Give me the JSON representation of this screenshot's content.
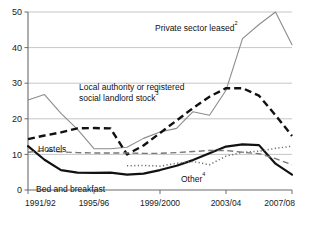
{
  "chart_data": {
    "type": "line",
    "title": "",
    "subtitle": "",
    "xlabel": "",
    "ylabel": "",
    "grid": true,
    "legend_position": "inline-annotations",
    "xlim": [
      1991,
      2007
    ],
    "ylim": [
      0,
      50
    ],
    "yticks": [
      0,
      10,
      20,
      30,
      40,
      50
    ],
    "ytick_labels": [
      "0",
      "10",
      "20",
      "30",
      "40",
      "50"
    ],
    "xticks": [
      1991,
      1995,
      1999,
      2003,
      2007
    ],
    "xtick_labels": [
      "1991/92",
      "1995/96",
      "1999/2000",
      "2003/04",
      "2007/08"
    ],
    "x": [
      1991,
      1992,
      1993,
      1994,
      1995,
      1996,
      1997,
      1998,
      1999,
      2000,
      2001,
      2002,
      2003,
      2004,
      2005,
      2006,
      2007
    ],
    "series": [
      {
        "name": "Private sector leased",
        "footnote": "2",
        "style": "solid-thin-grey",
        "color": "#8c8c8c",
        "values": [
          25.3,
          26.8,
          21.5,
          17.0,
          11.6,
          11.6,
          12.0,
          14.5,
          16.3,
          17.3,
          22.0,
          21.0,
          28.0,
          42.5,
          46.5,
          50.0,
          40.8
        ]
      },
      {
        "name": "Local authority or registered social landlord stock",
        "footnote": "3",
        "style": "dashed-thick-black",
        "color": "#111111",
        "values": [
          14.3,
          15.3,
          16.2,
          17.3,
          17.4,
          17.3,
          10.0,
          12.5,
          16.0,
          19.5,
          23.0,
          26.2,
          28.6,
          28.6,
          26.5,
          21.0,
          15.2
        ]
      },
      {
        "name": "Bed and breakfast",
        "footnote": "",
        "style": "solid-thick-black",
        "color": "#111111",
        "values": [
          12.3,
          8.5,
          5.6,
          4.9,
          4.8,
          4.9,
          4.3,
          4.6,
          5.6,
          6.8,
          8.4,
          10.3,
          12.2,
          12.8,
          12.6,
          7.4,
          4.3
        ]
      },
      {
        "name": "Hostels",
        "footnote": "",
        "style": "dashed-thin-grey",
        "color": "#777777",
        "values": [
          10.6,
          11.1,
          10.7,
          10.5,
          10.4,
          10.4,
          10.4,
          10.3,
          10.3,
          10.5,
          10.8,
          11.1,
          11.1,
          10.6,
          10.2,
          8.8,
          7.1
        ]
      },
      {
        "name": "Other",
        "footnote": "4",
        "style": "dotted-grey",
        "color": "#6f6f6f",
        "values": [
          null,
          null,
          null,
          null,
          null,
          null,
          6.8,
          6.9,
          6.7,
          7.5,
          8.0,
          7.1,
          9.5,
          10.6,
          10.9,
          11.7,
          12.3
        ]
      }
    ],
    "annotations": [
      {
        "id": "private-sector-leased",
        "text": "Private sector leased",
        "sup": "2",
        "x": 155,
        "y": 31
      },
      {
        "id": "la-rsl-stock-line1",
        "text": "Local authority or registered",
        "sup": "",
        "x": 79,
        "y": 90
      },
      {
        "id": "la-rsl-stock-line2",
        "text": "social landlord stock",
        "sup": "3",
        "x": 79,
        "y": 101
      },
      {
        "id": "hostels",
        "text": "Hostels",
        "sup": "",
        "x": 38,
        "y": 152
      },
      {
        "id": "other",
        "text": "Other",
        "sup": "4",
        "x": 181,
        "y": 182
      },
      {
        "id": "bed-and-breakfast",
        "text": "Bed and breakfast",
        "sup": "",
        "x": 36,
        "y": 192
      }
    ],
    "colors": {
      "axis": "#6b6b6b",
      "gridline": "#b8b8b8",
      "grey_series": "#8c8c8c",
      "black_series": "#111111",
      "background": "#ffffff"
    }
  }
}
